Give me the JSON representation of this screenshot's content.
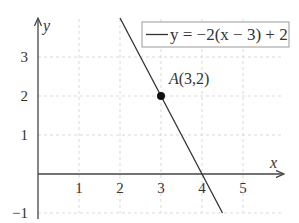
{
  "chart_data": {
    "type": "line",
    "title": "",
    "xlabel": "x",
    "ylabel": "y",
    "xlim": [
      0,
      5.8
    ],
    "ylim": [
      -1,
      4
    ],
    "grid": true,
    "grid_style": "dashed",
    "legend_position": "top-right",
    "x_ticks": [
      1,
      2,
      3,
      4,
      5
    ],
    "x_tick_labels": [
      "1",
      "2",
      "3",
      "4",
      "5"
    ],
    "y_ticks": [
      -1,
      1,
      2,
      3
    ],
    "y_tick_labels": [
      "−1",
      "1",
      "2",
      "3"
    ],
    "series": [
      {
        "name": "y = −2(x − 3) + 2",
        "equation": "y = -2(x-3)+2",
        "x": [
          2,
          4.5
        ],
        "y": [
          4,
          -1
        ],
        "color": "#333333"
      }
    ],
    "points": [
      {
        "label": "A(3,2)",
        "x": 3,
        "y": 2
      }
    ],
    "annotations": [
      "A(3,2)"
    ]
  },
  "legend": {
    "label": "y = −2(x − 3) + 2"
  },
  "axes": {
    "x_label": "x",
    "y_label": "y"
  },
  "colors": {
    "line": "#333333",
    "grid": "#d9d9d9",
    "axis": "#444444"
  }
}
